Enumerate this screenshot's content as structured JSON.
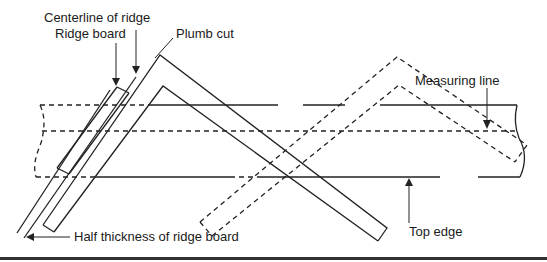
{
  "figure": {
    "type": "technical-diagram",
    "labels": {
      "centerline": "Centerline of ridge",
      "ridge_board": "Ridge board",
      "plumb_cut": "Plumb cut",
      "measuring_line": "Measuring line",
      "top_edge": "Top edge",
      "half_thickness": "Half thickness of ridge board"
    },
    "elements": [
      "rafter-stock",
      "measuring-line",
      "ridge-board",
      "framing-square-solid",
      "framing-square-dashed"
    ],
    "colors": {
      "line": "#222222",
      "background": "#ffffff",
      "rule": "#333333"
    }
  }
}
